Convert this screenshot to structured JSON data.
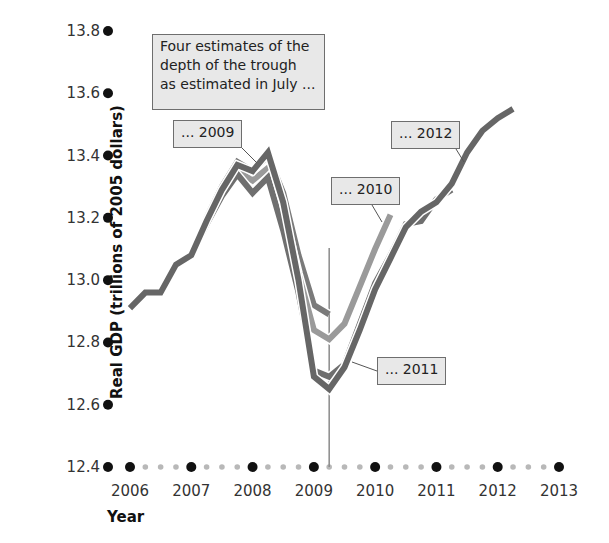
{
  "chart_data": {
    "type": "line",
    "title": "Four estimates of the depth of the trough as estimated in July ...",
    "xlabel": "Year",
    "ylabel": "Real GDP (trillions of 2005 dollars)",
    "ylim": [
      12.4,
      13.8
    ],
    "xlim": [
      2006,
      2013
    ],
    "yticks": [
      "13.8",
      "13.6",
      "13.4",
      "13.2",
      "13.0",
      "12.8",
      "12.6",
      "12.4"
    ],
    "xticks": [
      "2006",
      "2007",
      "2008",
      "2009",
      "2010",
      "2011",
      "2012",
      "2013"
    ],
    "grid": false,
    "legend": "inline callouts",
    "vertical_marker": {
      "x": 2009.25,
      "label": "trough"
    },
    "x": [
      2006.0,
      2006.25,
      2006.5,
      2006.75,
      2007.0,
      2007.25,
      2007.5,
      2007.75,
      2008.0,
      2008.25,
      2008.5,
      2008.75,
      2009.0,
      2009.25,
      2009.5,
      2009.75,
      2010.0,
      2010.25,
      2010.5,
      2010.75,
      2011.0,
      2011.25,
      2011.5,
      2011.75,
      2012.0,
      2012.25
    ],
    "series": [
      {
        "name": "... 2009",
        "color": "#7a7a7a",
        "values": [
          12.91,
          12.96,
          12.96,
          13.05,
          13.08,
          13.2,
          13.3,
          13.38,
          13.35,
          13.4,
          13.28,
          13.08,
          12.92,
          12.89,
          null,
          null,
          null,
          null,
          null,
          null,
          null,
          null,
          null,
          null,
          null,
          null
        ]
      },
      {
        "name": "... 2010",
        "color": "#9a9a9a",
        "values": [
          12.91,
          12.96,
          12.96,
          13.05,
          13.08,
          13.19,
          13.28,
          13.35,
          13.32,
          13.36,
          13.22,
          13.02,
          12.84,
          12.81,
          12.86,
          12.98,
          13.1,
          13.21,
          null,
          null,
          null,
          null,
          null,
          null,
          null,
          null
        ]
      },
      {
        "name": "... 2011",
        "color": "#6f6f6f",
        "values": [
          12.91,
          12.96,
          12.96,
          13.05,
          13.08,
          13.18,
          13.27,
          13.34,
          13.28,
          13.33,
          13.16,
          12.96,
          12.71,
          12.69,
          12.73,
          12.86,
          12.99,
          13.08,
          13.18,
          13.19,
          13.26,
          13.29,
          null,
          null,
          null,
          null
        ]
      },
      {
        "name": "... 2012",
        "color": "#666666",
        "values": [
          12.91,
          12.96,
          12.96,
          13.05,
          13.08,
          13.19,
          13.29,
          13.37,
          13.35,
          13.41,
          13.25,
          13.0,
          12.69,
          12.65,
          12.72,
          12.84,
          12.97,
          13.07,
          13.17,
          13.22,
          13.25,
          13.31,
          13.41,
          13.48,
          13.52,
          13.55
        ]
      }
    ]
  },
  "callouts": {
    "title": "Four estimates of the depth of the trough as estimated in July ...",
    "s2009": "... 2009",
    "s2010": "... 2010",
    "s2011": "... 2011",
    "s2012": "... 2012"
  },
  "axes": {
    "ylabel": "Real GDP (trillions of 2005 dollars)",
    "xlabel": "Year"
  }
}
